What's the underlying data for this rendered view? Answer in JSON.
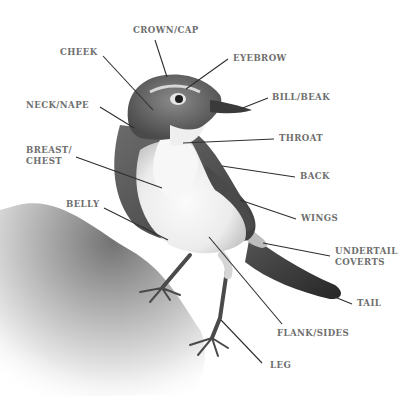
{
  "diagram": {
    "colors": {
      "label_text": "#6e6e6e",
      "leader_line": "#2e2e2e",
      "background": "#ffffff"
    },
    "labels": [
      {
        "id": "crown",
        "text": "CROWN/CAP",
        "x": 133,
        "y": 25,
        "target": [
          167,
          77
        ],
        "anchor": [
          155,
          40
        ]
      },
      {
        "id": "cheek",
        "text": "CHEEK",
        "x": 60,
        "y": 47,
        "target": [
          153,
          110
        ],
        "anchor": [
          103,
          56
        ]
      },
      {
        "id": "eyebrow",
        "text": "EYEBROW",
        "x": 233,
        "y": 53,
        "target": [
          186,
          89
        ],
        "anchor": [
          228,
          59
        ]
      },
      {
        "id": "neck",
        "text": "NECK/NAPE",
        "x": 26,
        "y": 100,
        "target": [
          134,
          128
        ],
        "anchor": [
          100,
          107
        ]
      },
      {
        "id": "bill",
        "text": "BILL/BEAK",
        "x": 272,
        "y": 92,
        "target": [
          240,
          109
        ],
        "anchor": [
          268,
          98
        ]
      },
      {
        "id": "throat",
        "text": "THROAT",
        "x": 279,
        "y": 133,
        "target": [
          183,
          143
        ],
        "anchor": [
          274,
          139
        ]
      },
      {
        "id": "breast",
        "text": "BREAST/\nCHEST",
        "x": 26,
        "y": 145,
        "target": [
          162,
          188
        ],
        "anchor": [
          76,
          157
        ]
      },
      {
        "id": "back",
        "text": "BACK",
        "x": 300,
        "y": 171,
        "target": [
          222,
          166
        ],
        "anchor": [
          295,
          177
        ]
      },
      {
        "id": "belly",
        "text": "BELLY",
        "x": 66,
        "y": 199,
        "target": [
          168,
          240
        ],
        "anchor": [
          104,
          208
        ]
      },
      {
        "id": "wings",
        "text": "WINGS",
        "x": 301,
        "y": 213,
        "target": [
          240,
          200
        ],
        "anchor": [
          296,
          219
        ]
      },
      {
        "id": "undertail",
        "text": "UNDERTAIL\nCOVERTS",
        "x": 335,
        "y": 246,
        "target": [
          263,
          243
        ],
        "anchor": [
          330,
          256
        ]
      },
      {
        "id": "tail",
        "text": "TAIL",
        "x": 357,
        "y": 298,
        "target": [
          310,
          287
        ],
        "anchor": [
          352,
          304
        ]
      },
      {
        "id": "flank",
        "text": "FLANK/SIDES",
        "x": 277,
        "y": 328,
        "target": [
          209,
          237
        ],
        "anchor": [
          282,
          324
        ]
      },
      {
        "id": "leg",
        "text": "LEG",
        "x": 270,
        "y": 360,
        "target": [
          221,
          320
        ],
        "anchor": [
          262,
          363
        ]
      }
    ]
  }
}
